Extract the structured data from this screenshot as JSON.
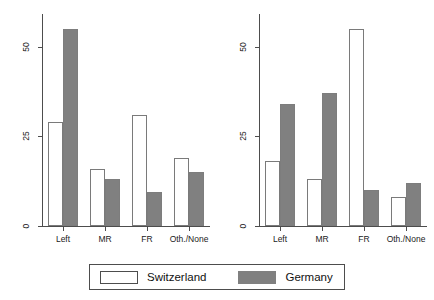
{
  "chart_data": {
    "type": "bar",
    "title": "",
    "subtitle": "",
    "xlabel": "",
    "categories": [
      "Left",
      "MR",
      "FR",
      "Oth./None"
    ],
    "legend": {
      "position": "bottom",
      "entries": [
        {
          "name": "Switzerland",
          "swatch": "white-outlined",
          "color": "#ffffff"
        },
        {
          "name": "Germany",
          "swatch": "gray-filled",
          "color": "#808080"
        }
      ]
    },
    "grid": false,
    "panels": [
      {
        "ylabel": "Hard, tiring work",
        "ylim": [
          0,
          58
        ],
        "yticks": [
          0,
          25,
          50
        ],
        "ytick_labels": [
          "0",
          "25",
          "50"
        ],
        "series": [
          {
            "name": "Switzerland",
            "values": [
              29,
              16,
              31,
              19
            ]
          },
          {
            "name": "Germany",
            "values": [
              55,
              13,
              9.5,
              15
            ]
          }
        ]
      },
      {
        "ylabel": "Rural",
        "ylim": [
          0,
          58
        ],
        "yticks": [
          0,
          25,
          50
        ],
        "ytick_labels": [
          "0",
          "25",
          "50"
        ],
        "series": [
          {
            "name": "Switzerland",
            "values": [
              18,
              13,
              55,
              8
            ]
          },
          {
            "name": "Germany",
            "values": [
              34,
              37,
              10,
              12
            ]
          }
        ]
      }
    ]
  },
  "colors": {
    "switzerland_fill": "#ffffff",
    "switzerland_border": "#7a7a7a",
    "germany_fill": "#808080",
    "axis": "#4d4d4d",
    "background": "#ffffff"
  }
}
